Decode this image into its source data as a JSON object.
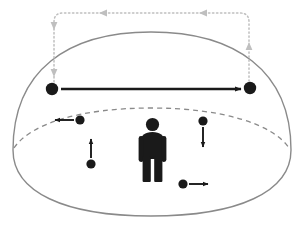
{
  "canvas": {
    "width": 305,
    "height": 235,
    "background": "#ffffff"
  },
  "palette": {
    "dome_stroke": "#8a8a8a",
    "horizon_stroke": "#8a8a8a",
    "measure_stroke": "#bfbfbf",
    "marker_fill": "#1a1a1a",
    "arrow_fill": "#1a1a1a",
    "person_fill": "#1a1a1a"
  },
  "scene": {
    "name": "personal-space-dome-diagram",
    "dome": {
      "name": "dome-outline",
      "style": "solid",
      "stroke": "#8a8a8a",
      "stroke_width": 1.4,
      "center_x": 151,
      "top_y": 32,
      "bottom_y": 216,
      "left_x": 12,
      "right_x": 292
    },
    "horizon": {
      "name": "horizon-ellipse-arc",
      "style": "dashed",
      "stroke": "#8a8a8a",
      "stroke_width": 1.3,
      "dash": "5 4",
      "center_x": 151,
      "center_y": 126,
      "radius_x": 138,
      "radius_y": 36
    },
    "person": {
      "name": "person-figure",
      "fill": "#1a1a1a",
      "center_x": 152,
      "head_y": 122,
      "foot_y": 182,
      "height_px": 62
    }
  },
  "anchor_markers": [
    {
      "name": "anchor-marker-left",
      "x": 52,
      "y": 89,
      "radius": 6.2,
      "fill": "#1a1a1a"
    },
    {
      "name": "anchor-marker-right",
      "x": 250,
      "y": 88,
      "radius": 6.2,
      "fill": "#1a1a1a"
    }
  ],
  "span_arrow": {
    "name": "span-double-arrow",
    "from_x": 61,
    "to_x": 241,
    "y": 89,
    "stroke": "#1a1a1a",
    "stroke_width": 2.6,
    "head": "end"
  },
  "motion_markers": [
    {
      "name": "motion-marker-left-outward",
      "dot_x": 80,
      "dot_y": 120,
      "radius": 4.6,
      "direction": "left",
      "arrow_from_x": 74,
      "arrow_to_x": 55,
      "arrow_y": 120
    },
    {
      "name": "motion-marker-left-upward",
      "dot_x": 91,
      "dot_y": 164,
      "radius": 4.6,
      "direction": "up",
      "arrow_from_y": 158,
      "arrow_to_y": 139,
      "arrow_x": 91
    },
    {
      "name": "motion-marker-right-downward",
      "dot_x": 203,
      "dot_y": 121,
      "radius": 4.6,
      "direction": "down",
      "arrow_from_y": 127,
      "arrow_to_y": 147,
      "arrow_x": 203
    },
    {
      "name": "motion-marker-right-outward",
      "dot_x": 183,
      "dot_y": 184,
      "radius": 4.6,
      "direction": "right",
      "arrow_from_x": 189,
      "arrow_to_x": 208,
      "arrow_y": 184
    }
  ],
  "measure_bracket": {
    "name": "measure-bracket",
    "stroke": "#bfbfbf",
    "stroke_width": 1.5,
    "dash": "1.5 2.5",
    "top_y": 13,
    "left_x": 54,
    "right_x": 249,
    "left_drop_to_y": 82,
    "right_drop_to_y": 81,
    "corner_radius": 9,
    "arrowheads": [
      {
        "name": "measure-arrowhead-top-left",
        "x": 103,
        "y": 13,
        "direction": "left"
      },
      {
        "name": "measure-arrowhead-top-right",
        "x": 203,
        "y": 13,
        "direction": "left"
      },
      {
        "name": "measure-arrowhead-left-upper",
        "x": 54,
        "y": 26,
        "direction": "down"
      },
      {
        "name": "measure-arrowhead-left-lower",
        "x": 54,
        "y": 71,
        "direction": "down"
      },
      {
        "name": "measure-arrowhead-right-mid",
        "x": 249,
        "y": 48,
        "direction": "up"
      }
    ]
  }
}
